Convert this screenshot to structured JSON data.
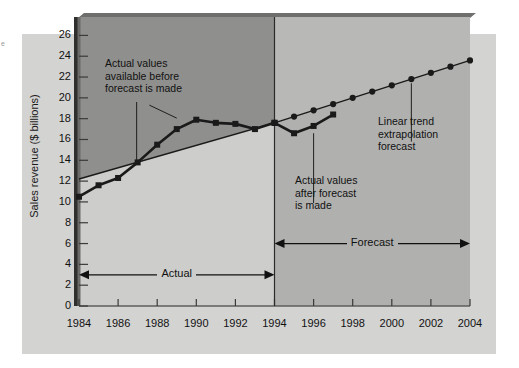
{
  "figure": {
    "background_color": "#ffffff",
    "panel_color": "#d3d3d1",
    "dark_region_color": "#8f8f8d",
    "forecast_band_color": "#b8b8b6",
    "below_trend_color": "#cdcdcb",
    "line_color": "#1a1a1a",
    "edge_fragment": "e"
  },
  "chart_data": {
    "type": "line",
    "title": "",
    "xlabel": "",
    "ylabel": "Sales revenue ($ billions)",
    "xlim": [
      1984,
      2004
    ],
    "ylim": [
      0,
      27
    ],
    "ytick_values": [
      0,
      2,
      4,
      6,
      8,
      10,
      12,
      14,
      16,
      18,
      20,
      22,
      24,
      26
    ],
    "ytick_labels": [
      "0",
      "2",
      "4",
      "6",
      "8",
      "10",
      "12",
      "14",
      "16",
      "18",
      "20",
      "22",
      "24",
      "26"
    ],
    "xtick_values": [
      1984,
      1986,
      1988,
      1990,
      1992,
      1994,
      1996,
      1998,
      2000,
      2002,
      2004
    ],
    "xtick_labels": [
      "1984",
      "1986",
      "1988",
      "1990",
      "1992",
      "1994",
      "1996",
      "1998",
      "2000",
      "2002",
      "2004"
    ],
    "xtick_minor": [
      1985,
      1987,
      1989,
      1991,
      1993,
      1995,
      1997,
      1999,
      2001,
      2003
    ],
    "grid": false,
    "legend": false,
    "forecast_origin_year": 1994,
    "series": [
      {
        "name": "Actual values available before forecast is made",
        "marker": "square",
        "x": [
          1984,
          1985,
          1986,
          1987,
          1988,
          1989,
          1990,
          1991,
          1992,
          1993,
          1994
        ],
        "values": [
          10.5,
          11.6,
          12.3,
          13.8,
          15.5,
          17.0,
          17.9,
          17.6,
          17.5,
          17.0,
          17.6
        ]
      },
      {
        "name": "Actual values after forecast is made",
        "marker": "square",
        "x": [
          1994,
          1995,
          1996,
          1997
        ],
        "values": [
          17.6,
          16.6,
          17.3,
          18.4
        ]
      },
      {
        "name": "Linear trend extrapolation forecast",
        "marker": "circle",
        "x": [
          1984,
          1994,
          1995,
          1996,
          1997,
          1998,
          1999,
          2000,
          2001,
          2002,
          2003,
          2004
        ],
        "values": [
          12.2,
          17.6,
          18.2,
          18.8,
          19.4,
          20.0,
          20.6,
          21.2,
          21.8,
          22.4,
          23.0,
          23.6
        ]
      }
    ],
    "annotations": [
      {
        "id": "actual-before",
        "text": "Actual values\navailable before\nforecast is made"
      },
      {
        "id": "actual-after",
        "text": "Actual values\nafter forecast\nis made"
      },
      {
        "id": "linear-trend",
        "text": "Linear trend\nextrapolation\nforecast"
      }
    ],
    "span_arrows": [
      {
        "id": "actual-span",
        "label": "Actual",
        "from_year": 1984,
        "to_year": 1994,
        "y_value": 3
      },
      {
        "id": "forecast-span",
        "label": "Forecast",
        "from_year": 1994,
        "to_year": 2004,
        "y_value": 6
      }
    ]
  },
  "annotations": {
    "actual_before_l1": "Actual values",
    "actual_before_l2": "available before",
    "actual_before_l3": "forecast is made",
    "actual_after_l1": "Actual values",
    "actual_after_l2": "after forecast",
    "actual_after_l3": "is made",
    "linear_l1": "Linear trend",
    "linear_l2": "extrapolation",
    "linear_l3": "forecast"
  },
  "span_labels": {
    "actual": "Actual",
    "forecast": "Forecast"
  },
  "axis": {
    "y_title": "Sales revenue ($ billions)"
  }
}
